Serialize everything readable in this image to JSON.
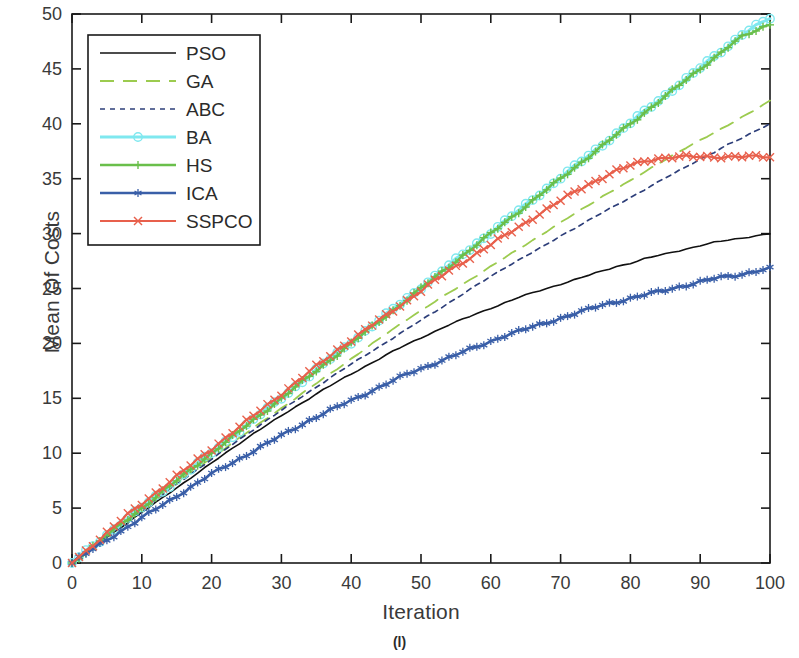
{
  "figure": {
    "caption": "(l)"
  },
  "chart_data": {
    "type": "line",
    "title": "",
    "xlabel": "Iteration",
    "ylabel": "Mean Of Costs",
    "xlim": [
      0,
      100
    ],
    "ylim": [
      0,
      50
    ],
    "xticks": [
      0,
      10,
      20,
      30,
      40,
      50,
      60,
      70,
      80,
      90,
      100
    ],
    "yticks": [
      0,
      5,
      10,
      15,
      20,
      25,
      30,
      35,
      40,
      45,
      50
    ],
    "grid": false,
    "legend_position": "upper-left",
    "x": [
      0,
      2,
      4,
      6,
      8,
      10,
      12,
      14,
      16,
      18,
      20,
      22,
      24,
      26,
      28,
      30,
      32,
      34,
      36,
      38,
      40,
      42,
      44,
      46,
      48,
      50,
      52,
      54,
      56,
      58,
      60,
      62,
      64,
      66,
      68,
      70,
      72,
      74,
      76,
      78,
      80,
      82,
      84,
      86,
      88,
      90,
      92,
      94,
      96,
      98,
      100
    ],
    "series": [
      {
        "name": "PSO",
        "color": "#111111",
        "style": "solid",
        "marker": "none",
        "width": 1.6,
        "values": [
          0,
          1.0,
          1.9,
          2.8,
          3.7,
          4.6,
          5.5,
          6.4,
          7.3,
          8.2,
          9.1,
          10.0,
          10.9,
          11.8,
          12.6,
          13.4,
          14.2,
          15.0,
          15.8,
          16.5,
          17.2,
          17.9,
          18.6,
          19.3,
          19.9,
          20.5,
          21.1,
          21.7,
          22.2,
          22.7,
          23.2,
          23.7,
          24.2,
          24.6,
          25.0,
          25.4,
          25.8,
          26.2,
          26.6,
          27.0,
          27.3,
          27.7,
          28.0,
          28.3,
          28.6,
          28.9,
          29.2,
          29.4,
          29.6,
          29.8,
          30.0
        ]
      },
      {
        "name": "GA",
        "color": "#9ccb4f",
        "style": "dashed",
        "marker": "none",
        "width": 1.8,
        "values": [
          0,
          1.05,
          2.05,
          3.05,
          4.0,
          4.95,
          5.9,
          6.85,
          7.8,
          8.7,
          9.6,
          10.5,
          11.4,
          12.3,
          13.2,
          14.1,
          15.0,
          15.9,
          16.8,
          17.7,
          18.6,
          19.5,
          20.4,
          21.3,
          22.2,
          23.0,
          23.8,
          24.6,
          25.4,
          26.2,
          27.0,
          27.8,
          28.6,
          29.4,
          30.2,
          31.0,
          31.8,
          32.6,
          33.4,
          34.1,
          34.8,
          35.6,
          36.4,
          37.1,
          37.8,
          38.5,
          39.2,
          39.9,
          40.6,
          41.3,
          42.1
        ]
      },
      {
        "name": "ABC",
        "color": "#2e3f7a",
        "style": "dotted",
        "marker": "none",
        "width": 1.7,
        "values": [
          0,
          1.0,
          1.95,
          2.9,
          3.85,
          4.8,
          5.75,
          6.7,
          7.65,
          8.55,
          9.45,
          10.35,
          11.25,
          12.15,
          13.05,
          13.9,
          14.75,
          15.6,
          16.45,
          17.3,
          18.1,
          18.9,
          19.7,
          20.5,
          21.3,
          22.1,
          22.9,
          23.7,
          24.5,
          25.3,
          26.1,
          26.9,
          27.6,
          28.3,
          29.0,
          29.8,
          30.5,
          31.2,
          31.9,
          32.6,
          33.3,
          34.0,
          34.7,
          35.4,
          36.1,
          36.8,
          37.4,
          38.1,
          38.7,
          39.4,
          40.0
        ]
      },
      {
        "name": "BA",
        "color": "#7fe8ef",
        "style": "solid",
        "marker": "circle",
        "width": 3.0,
        "values": [
          0,
          1.05,
          2.05,
          3.05,
          4.05,
          5.05,
          6.05,
          7.05,
          8.05,
          9.05,
          10.05,
          11.05,
          12.05,
          13.05,
          14.05,
          15.05,
          16.05,
          17.05,
          18.1,
          19.1,
          20.1,
          21.1,
          22.1,
          23.1,
          24.1,
          25.1,
          26.1,
          27.1,
          28.1,
          29.1,
          30.1,
          31.1,
          32.1,
          33.1,
          34.1,
          35.1,
          36.1,
          37.1,
          38.1,
          39.1,
          40.1,
          41.1,
          42.1,
          43.1,
          44.1,
          45.1,
          46.1,
          47.1,
          48.2,
          48.9,
          49.6
        ]
      },
      {
        "name": "HS",
        "color": "#6abf4b",
        "style": "solid",
        "marker": "plus",
        "width": 2.4,
        "values": [
          0,
          1.0,
          2.0,
          3.0,
          4.0,
          5.0,
          6.0,
          7.0,
          8.0,
          9.0,
          10.0,
          11.0,
          12.0,
          13.0,
          14.0,
          15.0,
          16.0,
          17.0,
          18.0,
          19.0,
          20.0,
          21.0,
          22.0,
          23.0,
          24.0,
          25.0,
          26.0,
          27.0,
          28.0,
          29.0,
          30.0,
          31.0,
          32.0,
          33.0,
          34.0,
          35.0,
          36.0,
          37.0,
          38.0,
          39.0,
          40.0,
          41.0,
          42.0,
          43.0,
          44.0,
          45.0,
          46.0,
          47.0,
          47.9,
          48.5,
          49.1
        ]
      },
      {
        "name": "ICA",
        "color": "#3a5fa8",
        "style": "solid",
        "marker": "asterisk",
        "width": 2.6,
        "values": [
          0,
          0.85,
          1.7,
          2.5,
          3.3,
          4.1,
          4.9,
          5.7,
          6.5,
          7.3,
          8.1,
          8.8,
          9.5,
          10.2,
          10.9,
          11.6,
          12.3,
          13.0,
          13.6,
          14.2,
          14.8,
          15.4,
          16.0,
          16.6,
          17.2,
          17.7,
          18.2,
          18.7,
          19.2,
          19.7,
          20.2,
          20.7,
          21.1,
          21.5,
          21.9,
          22.3,
          22.7,
          23.1,
          23.5,
          23.8,
          24.1,
          24.4,
          24.7,
          25.0,
          25.3,
          25.6,
          25.9,
          26.1,
          26.3,
          26.6,
          26.8
        ]
      },
      {
        "name": "SSPCO",
        "color": "#e8604c",
        "style": "solid",
        "marker": "x",
        "width": 2.2,
        "values": [
          0,
          1.1,
          2.2,
          3.3,
          4.4,
          5.4,
          6.4,
          7.4,
          8.4,
          9.4,
          10.4,
          11.4,
          12.4,
          13.4,
          14.4,
          15.4,
          16.4,
          17.4,
          18.4,
          19.4,
          20.3,
          21.2,
          22.1,
          23.0,
          23.9,
          24.8,
          25.7,
          26.6,
          27.4,
          28.2,
          29.0,
          29.8,
          30.6,
          31.4,
          32.2,
          33.0,
          33.8,
          34.5,
          35.1,
          35.7,
          36.2,
          36.6,
          36.85,
          36.95,
          37.0,
          37.0,
          37.0,
          37.0,
          37.0,
          37.0,
          37.0
        ]
      }
    ]
  }
}
